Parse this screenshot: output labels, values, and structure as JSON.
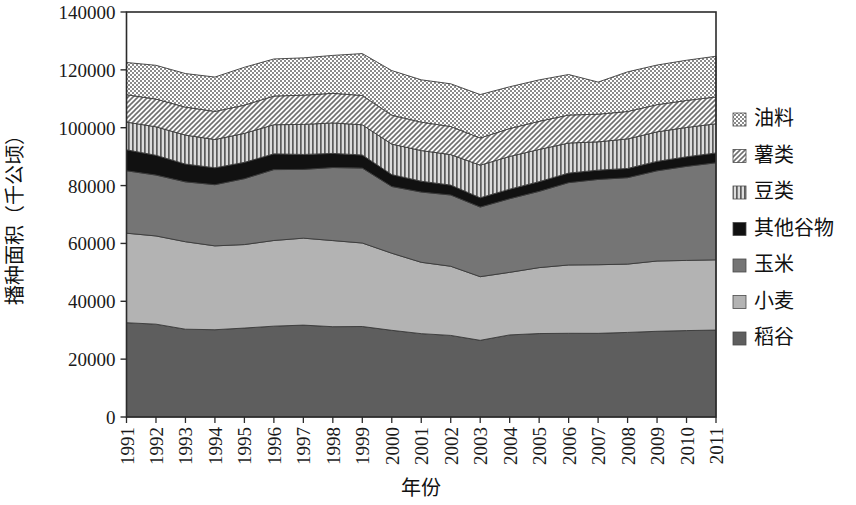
{
  "chart_data": {
    "type": "area",
    "title": "",
    "xlabel": "年份",
    "ylabel": "播种面积（千公顷）",
    "ylim": [
      0,
      140000
    ],
    "ytick_step": 20000,
    "yticks": [
      "0",
      "20000",
      "40000",
      "60000",
      "80000",
      "100000",
      "120000",
      "140000"
    ],
    "grid": false,
    "legend_position": "right",
    "stacked": true,
    "stack_order_bottom_to_top": [
      "稻谷",
      "小麦",
      "玉米",
      "其他谷物",
      "豆类",
      "薯类",
      "油料"
    ],
    "categories": [
      "1991",
      "1992",
      "1993",
      "1994",
      "1995",
      "1996",
      "1997",
      "1998",
      "1999",
      "2000",
      "2001",
      "2002",
      "2003",
      "2004",
      "2005",
      "2006",
      "2007",
      "2008",
      "2009",
      "2010",
      "2011"
    ],
    "x": [
      1991,
      1992,
      1993,
      1994,
      1995,
      1996,
      1997,
      1998,
      1999,
      2000,
      2001,
      2002,
      2003,
      2004,
      2005,
      2006,
      2007,
      2008,
      2009,
      2010,
      2011
    ],
    "series": [
      {
        "name": "稻谷",
        "color": "#5e5e5e",
        "pattern": "solid",
        "values": [
          32590,
          32090,
          30355,
          30171,
          30745,
          31406,
          31765,
          31214,
          31284,
          29962,
          28812,
          28202,
          26508,
          28379,
          28847,
          28938,
          28919,
          29241,
          29627,
          29873,
          30057
        ]
      },
      {
        "name": "小麦",
        "color": "#b3b3b3",
        "pattern": "solid",
        "values": [
          30948,
          30496,
          30235,
          28981,
          28860,
          29611,
          30057,
          29774,
          28855,
          26653,
          24664,
          23908,
          21997,
          21626,
          22793,
          23613,
          23721,
          23617,
          24291,
          24257,
          24270
        ]
      },
      {
        "name": "玉米",
        "color": "#757575",
        "pattern": "solid",
        "values": [
          21574,
          21044,
          20694,
          21152,
          22776,
          24498,
          23775,
          25239,
          25904,
          23056,
          24282,
          24634,
          24068,
          25446,
          26358,
          28463,
          29478,
          29864,
          31183,
          32500,
          33542
        ]
      },
      {
        "name": "其他谷物",
        "color": "#111111",
        "pattern": "solid",
        "values": [
          7248,
          6842,
          6144,
          5843,
          5640,
          5452,
          5164,
          4895,
          4529,
          4121,
          3748,
          3426,
          3210,
          3310,
          3358,
          3304,
          3216,
          3198,
          3262,
          3320,
          3401
        ]
      },
      {
        "name": "豆类",
        "color": "#9a9a9a",
        "pattern": "vertical-lines",
        "values": [
          9588,
          9843,
          10020,
          9767,
          10028,
          10070,
          10383,
          10532,
          10438,
          10538,
          10604,
          10531,
          11271,
          11318,
          11127,
          10391,
          9785,
          10215,
          10201,
          10142,
          10098
        ]
      },
      {
        "name": "薯类",
        "color": "#8f8f8f",
        "pattern": "diagonal-hatch",
        "values": [
          9456,
          9583,
          9673,
          9716,
          9740,
          9920,
          10095,
          10240,
          10136,
          10015,
          9815,
          9710,
          9412,
          9636,
          9735,
          9680,
          9552,
          9474,
          9398,
          9335,
          9270
        ]
      },
      {
        "name": "油料",
        "color": "#a8a8a8",
        "pattern": "dots",
        "values": [
          11135,
          11671,
          11603,
          11877,
          13101,
          12803,
          12906,
          13100,
          14480,
          15400,
          14630,
          14766,
          14990,
          14430,
          14318,
          14000,
          11100,
          13700,
          13700,
          13890,
          14070
        ]
      }
    ],
    "legend_entries_top_to_bottom": [
      {
        "label": "油料",
        "swatch": "dots"
      },
      {
        "label": "薯类",
        "swatch": "diagonal-hatch"
      },
      {
        "label": "豆类",
        "swatch": "vertical-lines"
      },
      {
        "label": "其他谷物",
        "swatch": "solid-black"
      },
      {
        "label": "玉米",
        "swatch": "solid-mid-gray"
      },
      {
        "label": "小麦",
        "swatch": "solid-light-gray"
      },
      {
        "label": "稻谷",
        "swatch": "solid-dark-gray"
      }
    ]
  },
  "colors": {
    "plot_border": "#2b2b2b",
    "text": "#111111",
    "background": "#ffffff"
  }
}
